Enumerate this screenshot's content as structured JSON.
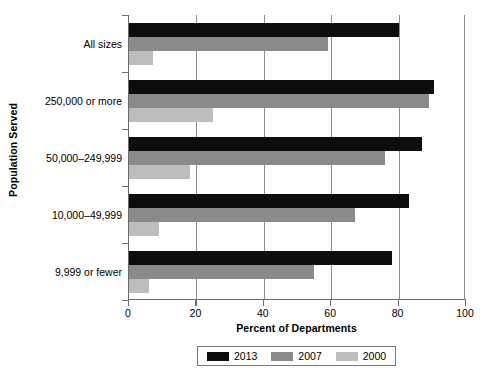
{
  "chart_data": {
    "type": "bar",
    "orientation": "horizontal",
    "title": "",
    "xlabel": "Percent of Departments",
    "ylabel": "Population Served",
    "xlim": [
      0,
      100
    ],
    "xticks": [
      0,
      20,
      40,
      60,
      80,
      100
    ],
    "xtick_labels": [
      "0",
      "20",
      "40",
      "60",
      "80",
      "100"
    ],
    "grid": "vertical",
    "legend_position": "bottom-center",
    "categories": [
      "All sizes",
      "250,000 or more",
      "50,000–249,999",
      "10,000–49,999",
      "9,999 or fewer"
    ],
    "series": [
      {
        "name": "2013",
        "color": "#0d0d0d",
        "values": [
          80,
          90.5,
          87,
          83,
          78
        ]
      },
      {
        "name": "2007",
        "color": "#8a8a8a",
        "values": [
          59,
          89,
          76,
          67,
          55
        ]
      },
      {
        "name": "2000",
        "color": "#bdbdbd",
        "values": [
          7,
          25,
          18,
          9,
          6
        ]
      }
    ]
  },
  "legend": {
    "entries": [
      {
        "label": "2013",
        "color": "#0d0d0d"
      },
      {
        "label": "2007",
        "color": "#8a8a8a"
      },
      {
        "label": "2000",
        "color": "#bdbdbd"
      }
    ]
  },
  "axes": {
    "x_title": "Percent of Departments",
    "y_title": "Population Served"
  }
}
